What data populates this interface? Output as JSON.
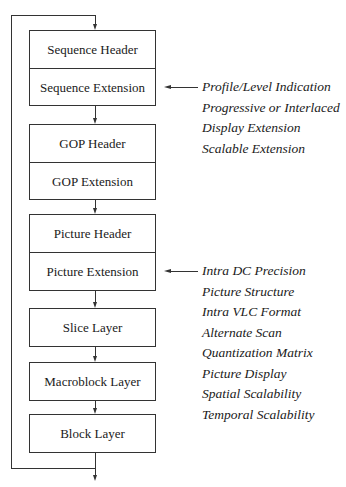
{
  "diagram": {
    "sequence": {
      "header": "Sequence Header",
      "extension": "Sequence Extension"
    },
    "gop": {
      "header": "GOP Header",
      "extension": "GOP Extension"
    },
    "picture": {
      "header": "Picture Header",
      "extension": "Picture Extension"
    },
    "slice": "Slice Layer",
    "macroblock": "Macroblock Layer",
    "block": "Block Layer"
  },
  "annotations": {
    "sequence_extension": [
      "Profile/Level Indication",
      "Progressive or Interlaced",
      "Display Extension",
      "Scalable Extension"
    ],
    "picture_extension": [
      "Intra DC Precision",
      "Picture Structure",
      "Intra VLC Format",
      "Alternate Scan",
      "Quantization Matrix",
      "Picture Display",
      "Spatial Scalability",
      "Temporal Scalability"
    ]
  }
}
